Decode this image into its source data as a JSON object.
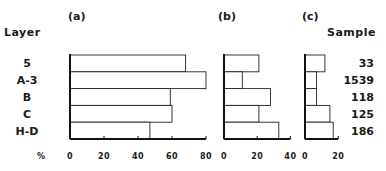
{
  "chart_data": [
    {
      "type": "bar",
      "orientation": "horizontal",
      "title": "(a)",
      "categories": [
        "5",
        "A-3",
        "B",
        "C",
        "H-D"
      ],
      "values": [
        68,
        80,
        59,
        60,
        47
      ],
      "xlabel": "%",
      "xlim": [
        0,
        80
      ],
      "xticks": [
        0,
        20,
        40,
        60,
        80
      ],
      "ylabel": "Layer"
    },
    {
      "type": "bar",
      "orientation": "horizontal",
      "title": "(b)",
      "categories": [
        "5",
        "A-3",
        "B",
        "C",
        "H-D"
      ],
      "values": [
        21,
        11,
        28,
        21,
        33
      ],
      "xlim": [
        0,
        40
      ],
      "xticks": [
        0,
        20,
        40
      ]
    },
    {
      "type": "bar",
      "orientation": "horizontal",
      "title": "(c)",
      "categories": [
        "5",
        "A-3",
        "B",
        "C",
        "H-D"
      ],
      "values": [
        12,
        7,
        7,
        15,
        17
      ],
      "xlim": [
        0,
        20
      ],
      "xticks": [
        0,
        20
      ],
      "right_label": "Sample",
      "sample_sizes": [
        "33",
        "1539",
        "118",
        "125",
        "186"
      ]
    }
  ],
  "labels": {
    "layer_header": "Layer",
    "sample_header": "Sample",
    "unit_label": "%"
  }
}
